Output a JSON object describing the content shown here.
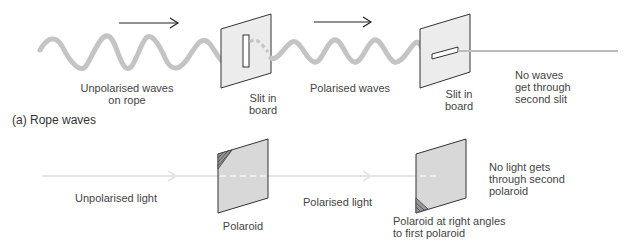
{
  "rope_section": {
    "caption": "(a) Rope waves",
    "labels": {
      "unpolarised": [
        "Unpolarised waves",
        "on rope"
      ],
      "slit1": [
        "Slit in",
        "board"
      ],
      "polarised": "Polarised waves",
      "slit2": [
        "Slit in",
        "board"
      ],
      "no_waves": [
        "No waves",
        "get through",
        "second slit"
      ]
    }
  },
  "light_section": {
    "labels": {
      "unpolarised": "Unpolarised light",
      "polaroid1": "Polaroid",
      "polarised": "Polarised light",
      "polaroid2": [
        "Polaroid at right angles",
        "to first polaroid"
      ],
      "no_light": [
        "No light gets",
        "through second",
        "polaroid"
      ]
    }
  },
  "colors": {
    "rope": "#c4c4c4",
    "board_fill": "#ececec",
    "polaroid_fill": "#d8d8d8",
    "outline": "#333333",
    "light_beam": "#e6e6e6"
  }
}
